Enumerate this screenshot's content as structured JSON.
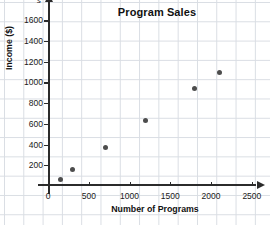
{
  "chart_data": {
    "type": "scatter",
    "title": "Program Sales",
    "xlabel": "Number of Programs",
    "ylabel": "Income ($)",
    "x_variable": "p",
    "y_variable": "s",
    "xlim": [
      0,
      2600
    ],
    "ylim": [
      0,
      1700
    ],
    "xticks": [
      0,
      500,
      1000,
      1500,
      2000,
      2500
    ],
    "xtick_labels": [
      "0",
      "500",
      "1000",
      "1500",
      "2000",
      "2500"
    ],
    "yticks": [
      200,
      400,
      600,
      800,
      1000,
      1200,
      1400,
      1600
    ],
    "ytick_labels": [
      "200",
      "400",
      "600",
      "800",
      "1000",
      "1200",
      "1400",
      "1600"
    ],
    "grid": true,
    "legend": null,
    "point_color": "#4d4d4d",
    "axis_color": "#2b2b2b",
    "grid_color": "#d9dde3",
    "points": [
      {
        "x": 150,
        "y": 65
      },
      {
        "x": 300,
        "y": 160
      },
      {
        "x": 700,
        "y": 375
      },
      {
        "x": 1200,
        "y": 630
      },
      {
        "x": 1800,
        "y": 945
      },
      {
        "x": 2100,
        "y": 1100
      }
    ]
  }
}
